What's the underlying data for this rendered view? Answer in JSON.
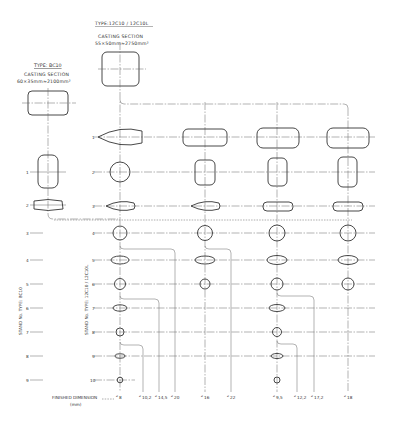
{
  "type_12c10": {
    "title": "TYPE:12C10 / 12C10L",
    "section_label": "CASTING SECTION",
    "section_dims": "55×50mm≈2750mm²"
  },
  "type_bc10": {
    "title": "TYPE: BC10",
    "section_label": "CASTING SECTION",
    "section_dims": "60×35mm≈2100mm²"
  },
  "axis_labels": {
    "bc10": "STAND No. TYPE: BC10",
    "c12": "STAND No. TYPE: 12C10 / 12C10L"
  },
  "bc10_stands": [
    "1",
    "2",
    "3",
    "4",
    "5",
    "6",
    "7",
    "8",
    "9"
  ],
  "c12_stands": [
    "1",
    "2",
    "3",
    "4",
    "5",
    "6",
    "7",
    "8",
    "9",
    "10"
  ],
  "finished_dimension": {
    "label": "FINISHED DIMENSION",
    "unit": "(mm)",
    "values": [
      {
        "sym": "⌀",
        "val": "8"
      },
      {
        "sym": "⌀",
        "val": "10,2"
      },
      {
        "sym": "⌀",
        "val": "14,5"
      },
      {
        "sym": "⌀",
        "val": "20"
      },
      {
        "sym": "⌀",
        "val": "16"
      },
      {
        "sym": "⌀",
        "val": "22"
      },
      {
        "sym": "⌀",
        "val": "9,5"
      },
      {
        "sym": "⌀",
        "val": "12,2"
      },
      {
        "sym": "⌀",
        "val": "17,2"
      },
      {
        "sym": "⌀",
        "val": "18"
      }
    ]
  },
  "colors": {
    "line": "#444444",
    "background": "#ffffff"
  }
}
